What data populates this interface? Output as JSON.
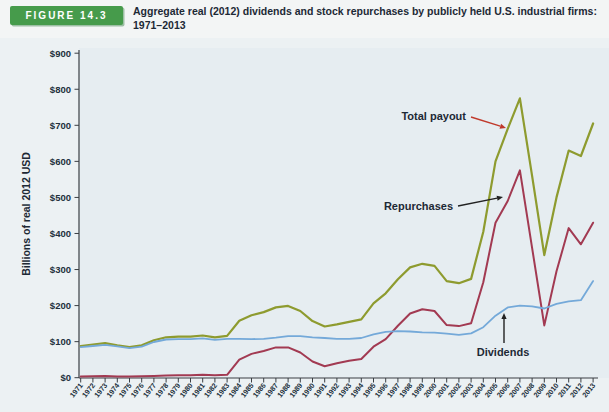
{
  "figure": {
    "label": "FIGURE 14.3",
    "title_line1": "Aggregate real (2012) dividends and stock repurchases by publicly held U.S. industrial firms:",
    "title_line2": "1971–2013"
  },
  "colors": {
    "badge_green": "#469b4b",
    "title_text": "#1d2935",
    "plot_background": "#e6edf1",
    "axis": "#3a3f44",
    "total_payout_line": "#8e9b2f",
    "repurchases_line": "#a23a52",
    "dividends_line": "#74a9d9",
    "annotation_arrow_red": "#c0392b",
    "annotation_arrow_black": "#222222"
  },
  "chart_data": {
    "type": "line",
    "title": "Aggregate real (2012) dividends and stock repurchases by publicly held U.S. industrial firms: 1971–2013",
    "xlabel": "",
    "ylabel": "Billions of real 2012 USD",
    "ylim": [
      0,
      900
    ],
    "ytick_step": 100,
    "ytick_labels": [
      "$0",
      "$100",
      "$200",
      "$300",
      "$400",
      "$500",
      "$600",
      "$700",
      "$800",
      "$900"
    ],
    "grid": false,
    "legend_position": "inline-annotations",
    "x": [
      1971,
      1972,
      1973,
      1974,
      1975,
      1976,
      1977,
      1978,
      1979,
      1980,
      1981,
      1982,
      1983,
      1984,
      1985,
      1986,
      1987,
      1988,
      1989,
      1990,
      1991,
      1992,
      1993,
      1994,
      1995,
      1996,
      1997,
      1998,
      1999,
      2000,
      2001,
      2002,
      2003,
      2004,
      2005,
      2006,
      2007,
      2008,
      2009,
      2010,
      2011,
      2012,
      2013
    ],
    "series": [
      {
        "name": "Total payout",
        "color": "#8e9b2f",
        "values": [
          88,
          92,
          96,
          90,
          85,
          90,
          104,
          112,
          114,
          114,
          117,
          112,
          116,
          158,
          173,
          182,
          195,
          199,
          185,
          157,
          142,
          148,
          155,
          162,
          206,
          234,
          273,
          306,
          316,
          310,
          268,
          262,
          274,
          405,
          600,
          690,
          775,
          560,
          340,
          500,
          630,
          615,
          705
        ]
      },
      {
        "name": "Repurchases",
        "color": "#a23a52",
        "values": [
          3,
          4,
          5,
          3,
          3,
          4,
          5,
          6,
          7,
          7,
          8,
          7,
          8,
          50,
          66,
          74,
          84,
          84,
          70,
          45,
          32,
          40,
          47,
          52,
          86,
          107,
          144,
          178,
          190,
          185,
          146,
          143,
          151,
          265,
          430,
          490,
          575,
          360,
          145,
          295,
          415,
          370,
          430
        ]
      },
      {
        "name": "Dividends",
        "color": "#74a9d9",
        "values": [
          85,
          88,
          91,
          87,
          82,
          86,
          99,
          106,
          107,
          107,
          109,
          105,
          108,
          108,
          107,
          108,
          111,
          115,
          115,
          112,
          110,
          108,
          108,
          110,
          120,
          127,
          129,
          128,
          126,
          125,
          122,
          119,
          123,
          140,
          172,
          195,
          200,
          198,
          192,
          205,
          212,
          215,
          268
        ]
      }
    ],
    "annotations": [
      {
        "text": "Total payout",
        "label_x": 466,
        "label_y": 120,
        "anchor": "end",
        "arrow": {
          "x1": 471,
          "y1": 117,
          "x2": 506,
          "y2": 128,
          "color": "#c0392b"
        }
      },
      {
        "text": "Repurchases",
        "label_x": 453,
        "label_y": 210,
        "anchor": "end",
        "arrow": {
          "x1": 458,
          "y1": 206,
          "x2": 503,
          "y2": 197,
          "color": "#222222"
        }
      },
      {
        "text": "Dividends",
        "label_x": 503,
        "label_y": 356,
        "anchor": "middle",
        "arrow": {
          "x1": 504,
          "y1": 343,
          "x2": 504,
          "y2": 313,
          "color": "#222222"
        }
      }
    ]
  }
}
